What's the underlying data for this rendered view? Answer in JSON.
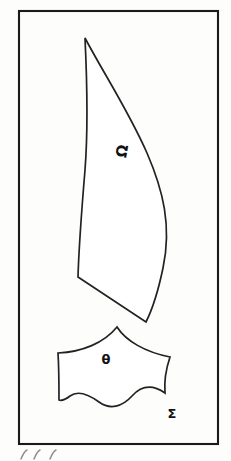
{
  "figure": {
    "type": "line-drawing",
    "medium": "scanned ink illustration",
    "background_color": "#fdfdfc",
    "ink_color": "#222222",
    "frame": {
      "name": "border-frame",
      "x": 19,
      "y": 11,
      "width": 199,
      "height": 433,
      "stroke_color": "#1a1a1a",
      "stroke_width": 2.1
    },
    "shapes": [
      {
        "id": "crescent",
        "name": "crescent-shape",
        "label": "Ω",
        "label_name": "omega",
        "label_x": 127,
        "label_y": 152,
        "label_size": 15,
        "label_rotation": -80,
        "path": "M 85 38 C 104 74 128 110 147 153 C 163 190 172 226 163 268 C 158 292 152 310 146 322 L 78 277 C 79 243 82 206 85 170 C 88 132 87 80 85 38 Z",
        "description": "tall curved blade-like crescent with sharp upper apex and angular lower base"
      },
      {
        "id": "shield",
        "name": "shield-shape",
        "label": "θ",
        "label_name": "theta",
        "label_x": 106,
        "label_y": 364,
        "label_size": 13,
        "label_rotation": 0,
        "path": "M 117 327 C 126 341 145 352 170 357 C 166 369 164 381 165 393 C 152 384 141 386 132 396 C 122 407 110 410 99 402 C 88 394 78 390 70 396 C 65 400 62 401 59 400 C 59 386 59 369 58 353 C 82 352 104 343 117 327 Z",
        "description": "shield or bell shaped fragment with concave upper arcs and scalloped wavy lower edge"
      }
    ],
    "annotations": [
      {
        "id": "sigma-label",
        "name": "sigma-label",
        "text": "Σ",
        "text_name": "sigma",
        "x": 172,
        "y": 418,
        "size": 13
      }
    ],
    "caption": {
      "name": "handwritten-caption",
      "visible_text": "",
      "description": "faint partially-cropped handwritten pen marks below the frame at the bottom edge of the image",
      "marks": [
        {
          "x": 21,
          "y": 452,
          "d": "M 21 459 C 23 454 25 451 27 450"
        },
        {
          "x": 34,
          "y": 452,
          "d": "M 34 459 C 36 454 38 451 40 450"
        },
        {
          "x": 50,
          "y": 452,
          "d": "M 50 459 C 52 454 54 451 56 450"
        }
      ]
    }
  }
}
